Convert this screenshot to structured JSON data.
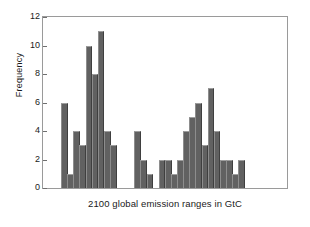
{
  "chart_data": {
    "type": "bar",
    "title": "",
    "subtitle": "",
    "xlabel": "2100 global emission ranges in GtC",
    "ylabel": "Frequency",
    "grid": false,
    "legend": null,
    "ylim": [
      0,
      12
    ],
    "ytick_labels": [
      "0",
      "2",
      "4",
      "6",
      "8",
      "10",
      "12"
    ],
    "ytick_values": [
      0,
      2,
      4,
      6,
      8,
      10,
      12
    ],
    "xtick_labels": [],
    "bar_color": "#616161",
    "frame_color": "#9a9a9a",
    "background": "#ffffff",
    "note": "Histogram of 2100 global emission ranges; bins with zero frequency appear as gaps.",
    "categories": [
      "b1",
      "b2",
      "b3",
      "b4",
      "b5",
      "b6",
      "b7",
      "b8",
      "b9",
      "b10",
      "b11",
      "b12",
      "b13",
      "b14",
      "b15",
      "b16",
      "b17",
      "b18",
      "b19",
      "b20",
      "b21",
      "b22",
      "b23",
      "b24",
      "b25",
      "b26",
      "b27",
      "b28",
      "b29",
      "b30",
      "b31",
      "b32",
      "b33",
      "b34",
      "b35",
      "b36",
      "b37",
      "b38"
    ],
    "values": [
      0,
      6,
      1,
      4,
      3,
      10,
      8,
      11,
      4,
      3,
      0,
      0,
      0,
      4,
      2,
      1,
      0,
      2,
      2,
      1,
      2,
      4,
      5,
      6,
      3,
      7,
      4,
      2,
      2,
      1,
      2,
      0,
      0,
      0,
      0,
      0,
      0,
      0
    ],
    "bars_drawn": [
      {
        "index": 1,
        "value": 6
      },
      {
        "index": 2,
        "value": 1
      },
      {
        "index": 3,
        "value": 4
      },
      {
        "index": 4,
        "value": 3
      },
      {
        "index": 5,
        "value": 10
      },
      {
        "index": 6,
        "value": 8
      },
      {
        "index": 7,
        "value": 11
      },
      {
        "index": 8,
        "value": 4
      },
      {
        "index": 9,
        "value": 3
      },
      {
        "index": 13,
        "value": 4
      },
      {
        "index": 14,
        "value": 2
      },
      {
        "index": 15,
        "value": 1
      },
      {
        "index": 17,
        "value": 2
      },
      {
        "index": 18,
        "value": 2
      },
      {
        "index": 19,
        "value": 1
      },
      {
        "index": 20,
        "value": 2
      },
      {
        "index": 21,
        "value": 4
      },
      {
        "index": 22,
        "value": 5
      },
      {
        "index": 23,
        "value": 6
      },
      {
        "index": 24,
        "value": 3
      },
      {
        "index": 25,
        "value": 7
      },
      {
        "index": 26,
        "value": 4
      },
      {
        "index": 27,
        "value": 2
      },
      {
        "index": 28,
        "value": 2
      },
      {
        "index": 29,
        "value": 1
      },
      {
        "index": 30,
        "value": 2
      }
    ]
  }
}
